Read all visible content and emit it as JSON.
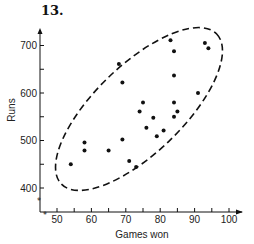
{
  "figure": {
    "number_label": "13."
  },
  "chart_data": {
    "type": "scatter",
    "title": "13.",
    "xlabel": "Games won",
    "ylabel": "Runs",
    "xlim": [
      45,
      105
    ],
    "ylim": [
      350,
      740
    ],
    "x_ticks": [
      50,
      60,
      70,
      80,
      90,
      100
    ],
    "x_minor_ticks": [
      55,
      65,
      75,
      85,
      95
    ],
    "y_ticks": [
      400,
      500,
      600,
      700
    ],
    "y_minor_ticks": [
      450,
      550,
      650
    ],
    "grid": false,
    "axis_breaks": true,
    "annotation": "dashed ellipse enclosing all points",
    "points": [
      {
        "x": 83,
        "y": 711
      },
      {
        "x": 84,
        "y": 688
      },
      {
        "x": 93,
        "y": 705
      },
      {
        "x": 94,
        "y": 694
      },
      {
        "x": 68,
        "y": 661
      },
      {
        "x": 69,
        "y": 622
      },
      {
        "x": 84,
        "y": 637
      },
      {
        "x": 91,
        "y": 600
      },
      {
        "x": 75,
        "y": 580
      },
      {
        "x": 74,
        "y": 561
      },
      {
        "x": 78,
        "y": 548
      },
      {
        "x": 84,
        "y": 580
      },
      {
        "x": 85,
        "y": 561
      },
      {
        "x": 84,
        "y": 550
      },
      {
        "x": 76,
        "y": 527
      },
      {
        "x": 81,
        "y": 521
      },
      {
        "x": 79,
        "y": 509
      },
      {
        "x": 69,
        "y": 502
      },
      {
        "x": 58,
        "y": 496
      },
      {
        "x": 58,
        "y": 479
      },
      {
        "x": 65,
        "y": 479
      },
      {
        "x": 54,
        "y": 450
      },
      {
        "x": 71,
        "y": 457
      },
      {
        "x": 73,
        "y": 444
      }
    ]
  }
}
